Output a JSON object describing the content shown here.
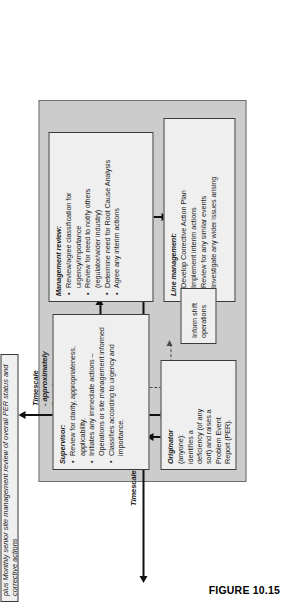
{
  "figure": {
    "caption": "FIGURE 10.15"
  },
  "timescales": [
    {
      "id": "three-working-days",
      "label": "Timescale – approximately 3 working days",
      "orientation": "vertical-measure"
    },
    {
      "id": "two-weeks",
      "label": "Timescale\n- approximately\n2 weeks",
      "orientation": "horizontal-measure"
    }
  ],
  "boxes": {
    "originator": {
      "header": "Originator",
      "lines": [
        "(anyone):",
        "identifies a",
        "deficiency (of any",
        "sort) and raises a",
        "Problem Event",
        "Report (PER)."
      ]
    },
    "supervisor": {
      "header": "Supervisor:",
      "items": [
        "Review for clarity, appropriateness, applicability.",
        "Initiates any immediate actions – Operations or site management informed",
        "Classifies according to urgency and importance."
      ]
    },
    "management_review": {
      "header": "Management review:",
      "items": [
        "Review/agree classification for urgency/importance",
        "Review for need to notify others (regulator/wider industry)",
        "Determine need for Root Cause Analysis",
        "Agree any interim actions"
      ]
    },
    "line_management": {
      "header": "Line management:",
      "items": [
        "Develop Corrective Action Plan",
        "Implement interim actions",
        "Review for any similar events",
        "Investigate any wider issues arising"
      ]
    },
    "inform_shift": {
      "text": "Inform shift operations"
    },
    "monthly_review": {
      "text": "plus Monthly senior site management review of overall PER status and corrective actions"
    }
  },
  "connectors": [
    {
      "id": "originator-to-supervisor",
      "style": "solid",
      "head": "single"
    },
    {
      "id": "supervisor-to-management-review",
      "style": "solid",
      "head": "single"
    },
    {
      "id": "management-review-to-line-management",
      "style": "solid",
      "head": "single"
    },
    {
      "id": "supervisor-to-inform-shift",
      "style": "dashed",
      "head": "single"
    }
  ],
  "colors": {
    "panel_fill": "#cccccc",
    "box_fill": "#efefef",
    "box_border": "#3a3a3a",
    "ink": "#111111",
    "dashed": "#4a4a4a",
    "page": "#ffffff"
  }
}
